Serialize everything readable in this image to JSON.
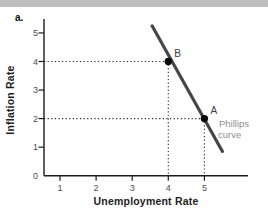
{
  "page": {
    "panel_label": "a.",
    "top_bar_color": "#bdbdbd",
    "background_color": "#ffffff"
  },
  "chart_data": {
    "type": "line",
    "title": "",
    "xlabel": "Unemployment Rate",
    "ylabel": "Inflation Rate",
    "xlim": [
      0,
      5.8
    ],
    "ylim": [
      0,
      5.5
    ],
    "x_ticks": [
      1,
      2,
      3,
      4,
      5
    ],
    "y_ticks": [
      0,
      1,
      2,
      3,
      4,
      5
    ],
    "origin_label": "0",
    "grid": false,
    "legend": "none",
    "axis_color": "#1c1c1c",
    "tick_label_color": "#4d4d4d",
    "series": [
      {
        "name": "Phillips curve",
        "color": "#464646",
        "points": [
          [
            3.55,
            5.25
          ],
          [
            5.5,
            0.85
          ]
        ]
      }
    ],
    "marked_points": [
      {
        "label": "B",
        "x": 4,
        "y": 4
      },
      {
        "label": "A",
        "x": 5,
        "y": 2
      }
    ],
    "guide_lines": "dotted black lines from each axis to points A and B",
    "curve_annotation": {
      "lines": [
        "Phillips",
        "curve"
      ],
      "color": "#8f8f8f"
    },
    "point_color": "#0a0a0a",
    "point_label_color": "#3c3c3c"
  }
}
